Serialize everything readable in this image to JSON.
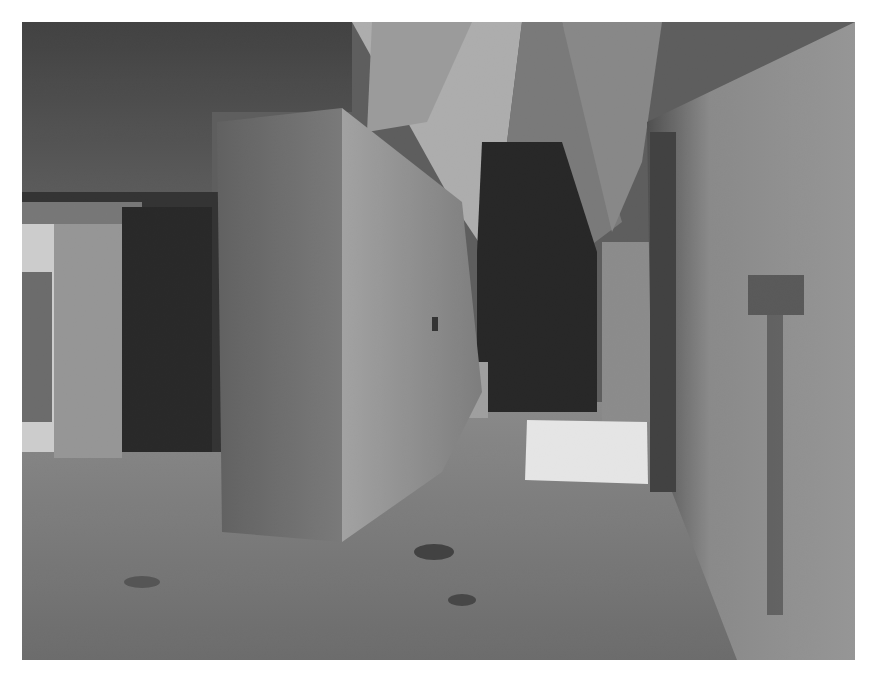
{
  "image": {
    "kind": "photograph",
    "tone": "black-and-white",
    "subject": "Stone corridor with corbel-vaulted ceilings and square pillars; sunlight patch on floor",
    "frame": {
      "x": 22,
      "y": 22,
      "width": 833,
      "height": 638,
      "background": "#ffffff"
    }
  },
  "scene": {
    "elements": [
      {
        "name": "left-doorway",
        "description": "Bright opening at left with foliage visible outside"
      },
      {
        "name": "central-pillar",
        "description": "Large square stone pillar in center foreground"
      },
      {
        "name": "vaulted-ceiling",
        "description": "Inverted-V corbel vault converging toward back"
      },
      {
        "name": "rear-chamber",
        "description": "Dark rear room at end of corridor with small stone block"
      },
      {
        "name": "sunlit-floor-patch",
        "description": "Bright rectangle of sunlight on the floor"
      },
      {
        "name": "right-wall",
        "description": "Textured plastered wall with small niche/bracket"
      }
    ],
    "colors": {
      "highlight": "#f4f4f4",
      "midtone": "#8a8a8a",
      "shadow": "#1a1a1a"
    }
  }
}
